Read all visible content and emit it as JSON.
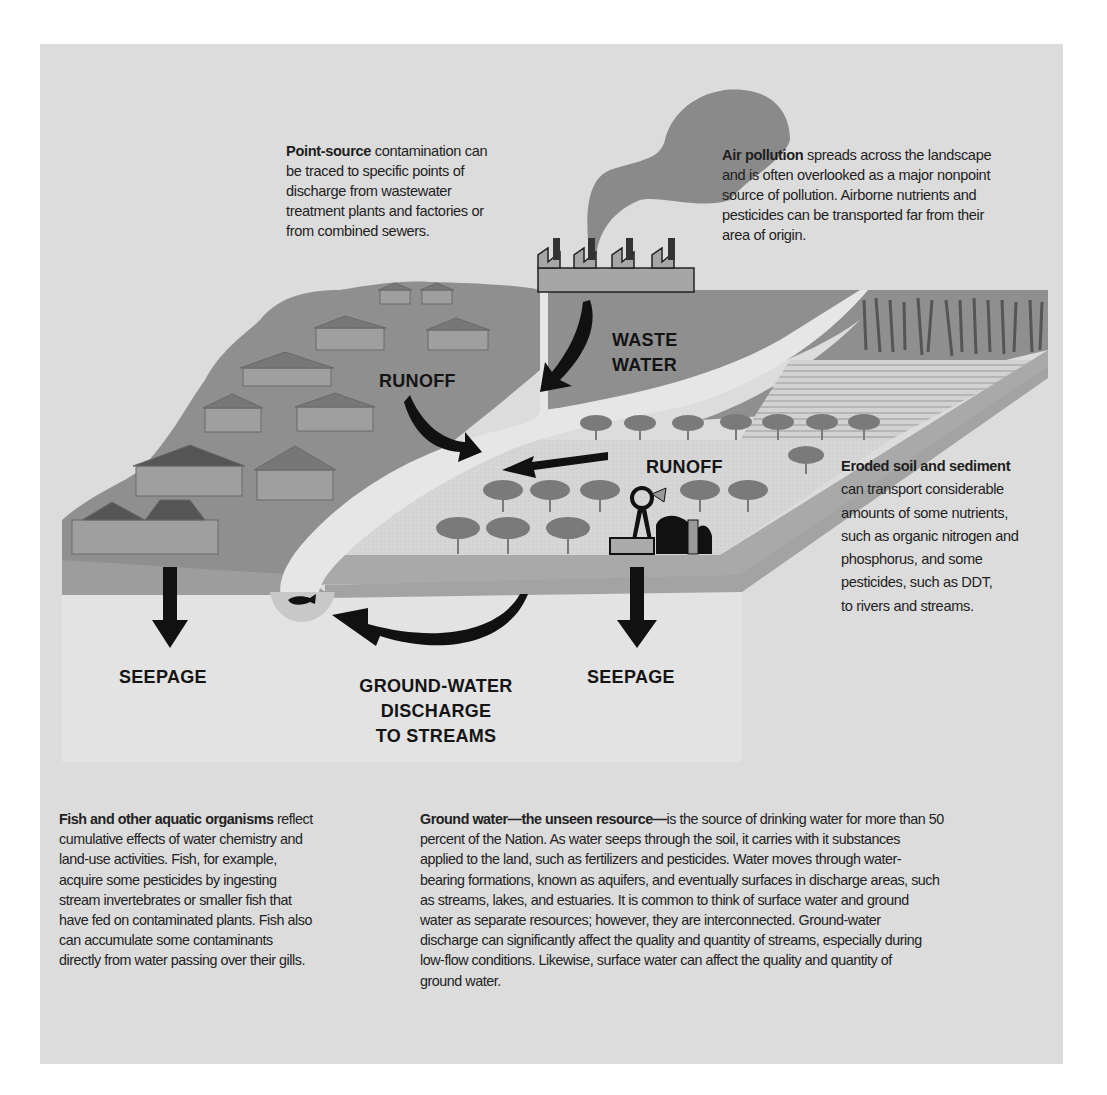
{
  "diagram": {
    "type": "landscape-water-quality-illustration",
    "colors": {
      "panel_background": "#dcdcdc",
      "land_dark": "#8f8f8f",
      "land_light": "#d4d4d4",
      "stream": "#e6e6e6",
      "underground": "#e2e2e2",
      "smoke": "#8a8a8a",
      "arrows": "#111111",
      "text": "#1e1e1e"
    },
    "labels": {
      "runoff_residential": "RUNOFF",
      "waste_water_line1": "WASTE",
      "waste_water_line2": "WATER",
      "runoff_agricultural": "RUNOFF",
      "seepage_left": "SEEPAGE",
      "seepage_right": "SEEPAGE",
      "gw_discharge_line1": "GROUND-WATER",
      "gw_discharge_line2": "DISCHARGE",
      "gw_discharge_line3": "TO STREAMS"
    },
    "callouts": {
      "point_source": {
        "bold": "Point-source",
        "lines": [
          " contamination can",
          "be traced to specific points of",
          "discharge from wastewater",
          "treatment plants and factories or",
          "from combined sewers."
        ]
      },
      "air_pollution": {
        "bold": "Air pollution",
        "lines": [
          " spreads across the landscape",
          "and is often overlooked as a major nonpoint",
          "source of pollution. Airborne nutrients and",
          "pesticides can be transported far from their",
          "area of origin."
        ]
      },
      "eroded_soil": {
        "bold": "Eroded soil and sediment",
        "lines": [
          "can transport considerable",
          "amounts of some nutrients,",
          "such as organic nitrogen and",
          "phosphorus, and some",
          "pesticides, such as DDT,",
          "to rivers and streams."
        ]
      }
    },
    "icons": [
      "factory-icon",
      "smoke-plume-icon",
      "house-icon",
      "tree-icon",
      "windmill-icon",
      "barn-icon",
      "corn-field-icon",
      "fish-icon",
      "arrow-icon"
    ]
  },
  "text_blocks": {
    "fish": {
      "bold": "Fish and other aquatic organisms",
      "lines": [
        " reflect",
        "cumulative effects of water chemistry and",
        "land-use activities. Fish, for example,",
        "acquire some pesticides by ingesting",
        "stream invertebrates or smaller fish that",
        "have fed on contaminated plants. Fish also",
        "can accumulate some contaminants",
        "directly from water passing over their gills."
      ]
    },
    "ground_water": {
      "bold": "Ground water—the unseen resource—",
      "lines": [
        "is the source of drinking water for more than 50",
        "percent of the Nation. As water seeps through the soil, it carries with it substances",
        "applied to the land, such as fertilizers and pesticides. Water moves through water-",
        "bearing formations, known as aquifers, and eventually surfaces in discharge areas, such",
        "as streams, lakes, and estuaries. It is common to think of surface water and ground",
        "water as separate resources; however, they are interconnected. Ground-water",
        "discharge can significantly affect the quality and quantity of streams, especially during",
        "low-flow conditions. Likewise, surface water can affect the quality and quantity of",
        "ground water."
      ]
    }
  }
}
